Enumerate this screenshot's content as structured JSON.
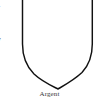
{
  "page": {
    "background_color": "#ffffff",
    "ink_color": "#111111",
    "width": 99,
    "height": 99
  },
  "left_column": {
    "name": "cropped-text-column",
    "description": "partially cropped characters at the left page edge",
    "glyphs": [
      {
        "text": "1",
        "top": 1
      },
      {
        "text": "s",
        "top": 19
      },
      {
        "text": "y",
        "top": 36
      },
      {
        "text": "-",
        "top": 53
      },
      {
        "text": "s",
        "top": 69
      }
    ]
  },
  "figure": {
    "name": "heraldic-shield",
    "shape": "escutcheon",
    "tincture": "Argent",
    "fill_color": "#ffffff",
    "stroke_color": "#111111",
    "stroke_width": 1.4,
    "geometry": {
      "left_edge_x": 22,
      "right_edge_x": 92,
      "top_y": -6,
      "shoulder_y": 48,
      "point_x": 58,
      "point_y": 89
    }
  },
  "caption": {
    "text": "Argent",
    "align": "center"
  }
}
